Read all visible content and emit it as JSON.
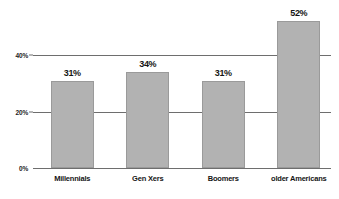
{
  "chart_data": {
    "type": "bar",
    "title": "",
    "subtitle": "",
    "xlabel": "",
    "ylabel": "",
    "categories": [
      "Millennials",
      "Gen Xers",
      "Boomers",
      "older Americans"
    ],
    "values": [
      31,
      34,
      31,
      52
    ],
    "value_labels": [
      "31%",
      "34%",
      "31%",
      "52%"
    ],
    "ylim": [
      0,
      56
    ],
    "yticks": [
      0,
      20,
      40
    ],
    "ytick_labels": [
      "0%",
      "20%",
      "40%"
    ],
    "grid": true,
    "grid_axis": "y",
    "legend": false,
    "legend_position": "none",
    "bar_color": "#b2b2b2",
    "bar_edge_color": "#9a9a9a",
    "axis_color": "#6e6e6e",
    "text_color": "#151515",
    "background_color": "#ffffff"
  }
}
